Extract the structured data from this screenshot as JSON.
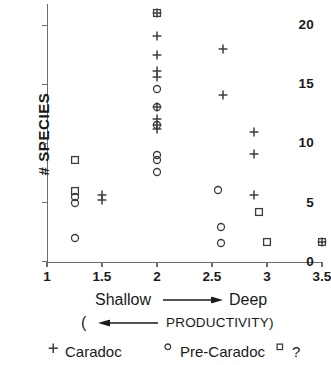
{
  "chart_data": {
    "type": "scatter",
    "title": "",
    "xlabel": "Shallow → Deep ( ← PRODUCTIVITY)",
    "ylabel": "# SPECIES",
    "xlim": [
      1,
      3.5
    ],
    "ylim": [
      0,
      21.8
    ],
    "xticks": [
      "1",
      "1.5",
      "2",
      "2.5",
      "3",
      "3.5"
    ],
    "xtick_values": [
      1,
      1.5,
      2,
      2.5,
      3,
      3.5
    ],
    "yticks": [
      "0",
      "5",
      "10",
      "15",
      "20"
    ],
    "ytick_values": [
      0,
      5,
      10,
      15,
      20
    ],
    "grid": false,
    "legend_position": "below",
    "series": [
      {
        "name": "Caradoc",
        "marker": "plus",
        "points": [
          {
            "x": 1.5,
            "y": 5.2
          },
          {
            "x": 1.5,
            "y": 5.6
          },
          {
            "x": 2.0,
            "y": 21.0
          },
          {
            "x": 2.0,
            "y": 19.1
          },
          {
            "x": 2.0,
            "y": 17.5
          },
          {
            "x": 2.0,
            "y": 16.1
          },
          {
            "x": 2.0,
            "y": 15.6
          },
          {
            "x": 2.0,
            "y": 13.1
          },
          {
            "x": 2.0,
            "y": 12.1
          },
          {
            "x": 2.0,
            "y": 11.6
          },
          {
            "x": 2.0,
            "y": 11.2
          },
          {
            "x": 2.6,
            "y": 18.0
          },
          {
            "x": 2.6,
            "y": 14.1
          },
          {
            "x": 2.88,
            "y": 11.0
          },
          {
            "x": 2.88,
            "y": 9.1
          },
          {
            "x": 2.88,
            "y": 5.6
          },
          {
            "x": 3.5,
            "y": 1.7
          }
        ]
      },
      {
        "name": "Pre-Caradoc",
        "marker": "circle",
        "points": [
          {
            "x": 1.25,
            "y": 5.5
          },
          {
            "x": 1.25,
            "y": 5.0
          },
          {
            "x": 1.25,
            "y": 2.0
          },
          {
            "x": 2.0,
            "y": 14.6
          },
          {
            "x": 2.0,
            "y": 13.1
          },
          {
            "x": 2.0,
            "y": 11.6
          },
          {
            "x": 2.0,
            "y": 9.0
          },
          {
            "x": 2.0,
            "y": 8.6
          },
          {
            "x": 2.0,
            "y": 7.6
          },
          {
            "x": 2.55,
            "y": 6.1
          },
          {
            "x": 2.58,
            "y": 2.9
          },
          {
            "x": 2.58,
            "y": 1.6
          }
        ]
      },
      {
        "name": "?",
        "marker": "square",
        "points": [
          {
            "x": 1.25,
            "y": 8.6
          },
          {
            "x": 1.25,
            "y": 6.0
          },
          {
            "x": 2.0,
            "y": 21.0
          },
          {
            "x": 2.93,
            "y": 4.2
          },
          {
            "x": 3.0,
            "y": 1.7
          },
          {
            "x": 3.5,
            "y": 1.7
          }
        ]
      }
    ]
  },
  "axes": {
    "y_title": "# SPECIES",
    "x_ticks": [
      "1",
      "1.5",
      "2",
      "2.5",
      "3",
      "3.5"
    ],
    "y_ticks": [
      "0",
      "5",
      "10",
      "15",
      "20"
    ]
  },
  "caption": {
    "shallow": "Shallow",
    "deep": "Deep",
    "open_paren": "(",
    "productivity": "PRODUCTIVITY)"
  },
  "legend": {
    "items": [
      {
        "marker": "plus",
        "label": "Caradoc"
      },
      {
        "marker": "circle",
        "label": "Pre-Caradoc"
      },
      {
        "marker": "square",
        "label": "?"
      }
    ]
  },
  "colors": {
    "ink": "#1a1a1a",
    "axis": "#6d6d6d",
    "marker": "#3d3d3d"
  }
}
